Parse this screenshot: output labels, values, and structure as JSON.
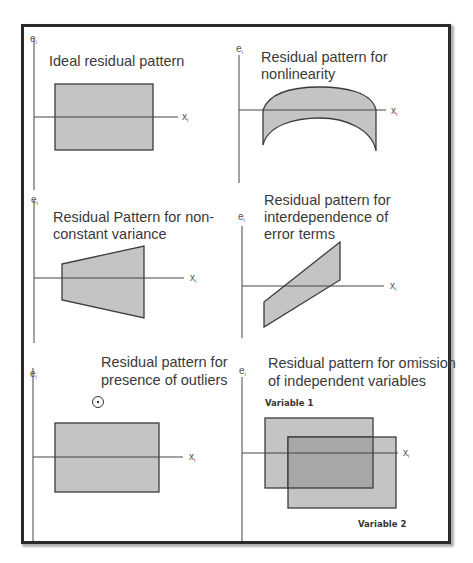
{
  "figure": {
    "colors": {
      "frame": "#2a2a2a",
      "fill": "#c4c4c4",
      "fill_overlap": "#a7a7a7",
      "stroke": "#3c3c3c",
      "text": "#3a3a3a"
    },
    "axis_labels": {
      "y": "e",
      "y_sub": "i",
      "x": "x",
      "x_sub": "i"
    },
    "panels": [
      {
        "id": "ideal",
        "title_lines": [
          "Ideal residual pattern"
        ],
        "shape": "rectangle"
      },
      {
        "id": "nonlinearity",
        "title_lines": [
          "Residual pattern for",
          "nonlinearity"
        ],
        "shape": "arch band"
      },
      {
        "id": "nonconstant-variance",
        "title_lines": [
          "Residual Pattern for non-",
          "constant variance"
        ],
        "shape": "widening trapezoid"
      },
      {
        "id": "interdependence",
        "title_lines": [
          "Residual pattern for",
          "interdependence of",
          "error terms"
        ],
        "shape": "rising parallelogram"
      },
      {
        "id": "outliers",
        "title_lines": [
          "Residual pattern for",
          "presence of outliers"
        ],
        "shape": "rectangle with outlier point"
      },
      {
        "id": "omission",
        "title_lines": [
          "Residual pattern for omission",
          "of independent variables"
        ],
        "shape": "two overlapping rectangles",
        "series_labels": [
          "Variable 1",
          "Variable 2"
        ]
      }
    ]
  }
}
